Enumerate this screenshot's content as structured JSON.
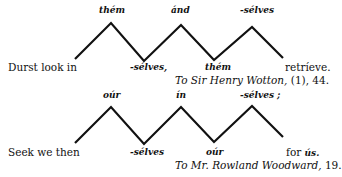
{
  "examples": [
    {
      "lead": "Durst look in",
      "peaks": [
        "thém",
        "ánd",
        "-sélves"
      ],
      "valleys": [
        "-sélves,",
        "thém"
      ],
      "end": "retríeve.",
      "source_title": "To Sir Henry Wotton,",
      "source_ref": "(1), 44.",
      "zigzag_points": "75,59 111,23 144,61 181,25 214,60 252,27 283,58"
    },
    {
      "lead": "Seek we then",
      "peaks": [
        "oúr",
        "ín",
        "-sélves ;"
      ],
      "valleys": [
        "-sélves",
        "oúr"
      ],
      "end_plain": "for ",
      "end_it": "ús.",
      "source_title": "To Mr. Rowland Woodward,",
      "source_ref": "19.",
      "zigzag_points": "75,143 111,107 144,144 181,107 214,142 252,106 283,137"
    }
  ],
  "colors": {
    "line": "#111111",
    "background": "#ffffff"
  }
}
